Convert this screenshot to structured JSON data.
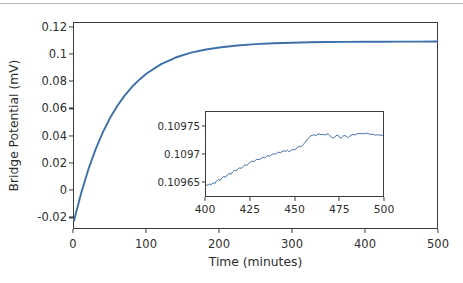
{
  "chart_data": [
    {
      "id": "main",
      "type": "line",
      "title": "",
      "xlabel": "Time (minutes)",
      "ylabel": "Bridge Potential (mV)",
      "xlim": [
        0,
        500
      ],
      "ylim": [
        -0.0285,
        0.1235
      ],
      "grid": false,
      "legend": null,
      "line_color": "#3d6fa8",
      "xticks": [
        0,
        100,
        200,
        300,
        400,
        500
      ],
      "xtick_labels": [
        "0",
        "100",
        "200",
        "300",
        "400",
        "500"
      ],
      "yticks": [
        -0.02,
        0,
        0.02,
        0.04,
        0.06,
        0.08,
        0.1,
        0.12
      ],
      "ytick_labels": [
        "-0.02",
        "0",
        "0.02",
        "0.04",
        "0.06",
        "0.08",
        "0.1",
        "0.12"
      ],
      "series": [
        {
          "name": "bridge potential",
          "model": "saturating-exponential",
          "y0": -0.0232,
          "y_inf": 0.10973,
          "tau_minutes": 58.0,
          "x": [
            0,
            10,
            20,
            30,
            40,
            50,
            60,
            70,
            80,
            90,
            100,
            120,
            140,
            160,
            180,
            200,
            225,
            250,
            275,
            300,
            325,
            350,
            375,
            400,
            425,
            450,
            475,
            500
          ],
          "values": [
            -0.0232,
            -0.0023,
            0.0153,
            0.0302,
            0.0428,
            0.0534,
            0.0623,
            0.0698,
            0.0762,
            0.0815,
            0.086,
            0.093,
            0.0979,
            0.1013,
            0.1037,
            0.1053,
            0.1068,
            0.1078,
            0.1085,
            0.1089,
            0.1092,
            0.1094,
            0.1095,
            0.1096,
            0.10965,
            0.1097,
            0.10972,
            0.10973
          ]
        }
      ]
    },
    {
      "id": "inset",
      "type": "line",
      "title": "",
      "xlabel": "",
      "ylabel": "",
      "xlim": [
        400,
        500
      ],
      "ylim": [
        0.1096225,
        0.1097775
      ],
      "grid": false,
      "legend": null,
      "line_color": "#3d6fa8",
      "xticks": [
        400,
        425,
        450,
        475,
        500
      ],
      "xtick_labels": [
        "400",
        "425",
        "450",
        "475",
        "500"
      ],
      "yticks": [
        0.10965,
        0.1097,
        0.10975
      ],
      "ytick_labels": [
        "0.10965",
        "0.1097",
        "0.10975"
      ],
      "series": [
        {
          "name": "bridge potential (zoom)",
          "noise_amplitude": 4e-06,
          "x": [
            400,
            401,
            402,
            403,
            404,
            405,
            406,
            407,
            408,
            409,
            410,
            411,
            412,
            413,
            414,
            415,
            416,
            417,
            418,
            419,
            420,
            421,
            422,
            423,
            424,
            425,
            426,
            427,
            428,
            429,
            430,
            431,
            432,
            433,
            434,
            435,
            436,
            437,
            438,
            439,
            440,
            441,
            442,
            443,
            444,
            445,
            446,
            447,
            448,
            449,
            450,
            451,
            452,
            453,
            454,
            455,
            456,
            457,
            458,
            459,
            460,
            461,
            462,
            463,
            464,
            465,
            466,
            467,
            468,
            469,
            470,
            471,
            472,
            473,
            474,
            475,
            476,
            477,
            478,
            479,
            480,
            481,
            482,
            483,
            484,
            485,
            486,
            487,
            488,
            489,
            490,
            491,
            492,
            493,
            494,
            495,
            496,
            497,
            498,
            499,
            500
          ],
          "values": [
            0.109644,
            0.1096415,
            0.109645,
            0.1096432,
            0.109647,
            0.1096455,
            0.1096505,
            0.109653,
            0.1096512,
            0.109656,
            0.1096585,
            0.109657,
            0.1096615,
            0.109664,
            0.1096625,
            0.109667,
            0.10967,
            0.1096688,
            0.1096725,
            0.1096745,
            0.1096735,
            0.109677,
            0.10968,
            0.109679,
            0.1096822,
            0.1096845,
            0.109687,
            0.109686,
            0.1096885,
            0.1096905,
            0.1096895,
            0.1096915,
            0.109694,
            0.1096928,
            0.109695,
            0.109697,
            0.109696,
            0.1096985,
            0.1097005,
            0.1096995,
            0.1097015,
            0.1097035,
            0.1097022,
            0.1097045,
            0.109706,
            0.1097048,
            0.109707,
            0.109704,
            0.1097065,
            0.1097085,
            0.1097075,
            0.10971,
            0.1097125,
            0.1097145,
            0.1097135,
            0.1097175,
            0.1097215,
            0.109726,
            0.10973,
            0.109733,
            0.1097345,
            0.1097355,
            0.109734,
            0.109736,
            0.109737,
            0.1097355,
            0.1097365,
            0.109735,
            0.1097362,
            0.1097372,
            0.109734,
            0.109731,
            0.1097295,
            0.109732,
            0.109735,
            0.109733,
            0.109729,
            0.1097315,
            0.1097345,
            0.109733,
            0.10973,
            0.1097322,
            0.1097348,
            0.1097362,
            0.109735,
            0.1097368,
            0.109738,
            0.1097372,
            0.1097382,
            0.109737,
            0.1097378,
            0.1097385,
            0.1097372,
            0.109736,
            0.1097368,
            0.1097355,
            0.1097348,
            0.1097358,
            0.1097345,
            0.109735,
            0.1097342
          ]
        }
      ]
    }
  ]
}
